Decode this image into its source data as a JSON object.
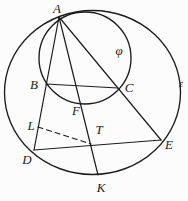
{
  "colors": {
    "ink": "#1c1c1c",
    "paper": "#fcfcfc"
  },
  "diagram": {
    "type": "geometry-figure",
    "labels": {
      "A": "A",
      "B": "B",
      "C": "C",
      "D": "D",
      "E": "E",
      "F": "F",
      "K": "K",
      "L": "L",
      "T": "T",
      "phi": "φ",
      "epsilon": "ε"
    },
    "points": [
      {
        "name": "A",
        "x": 59,
        "y": 17,
        "on": [
          "circle-epsilon",
          "circle-phi"
        ]
      },
      {
        "name": "B",
        "x": 46,
        "y": 84,
        "on": [
          "circle-phi",
          "line-AD"
        ]
      },
      {
        "name": "C",
        "x": 118,
        "y": 88,
        "on": [
          "circle-phi",
          "line-AE"
        ]
      },
      {
        "name": "F",
        "x": 80,
        "y": 103,
        "on": [
          "circle-phi",
          "line-AK"
        ]
      },
      {
        "name": "L",
        "x": 38,
        "y": 126,
        "on": [
          "line-AD"
        ]
      },
      {
        "name": "T",
        "x": 92,
        "y": 145,
        "on": [
          "line-AK",
          "line-DE"
        ]
      },
      {
        "name": "D",
        "x": 34,
        "y": 150,
        "on": [
          "circle-epsilon"
        ]
      },
      {
        "name": "E",
        "x": 161,
        "y": 140,
        "on": [
          "circle-epsilon"
        ]
      },
      {
        "name": "K",
        "x": 98,
        "y": 175,
        "on": [
          "circle-epsilon"
        ]
      }
    ],
    "circles": [
      {
        "name": "epsilon",
        "label": "ε",
        "cx": 92.5,
        "cy": 92.5,
        "rx": 88,
        "ry": 82
      },
      {
        "name": "phi",
        "label": "φ",
        "cx": 85,
        "cy": 58,
        "r": 46
      }
    ],
    "segments": [
      {
        "name": "line-AD",
        "from": "A",
        "to": "D",
        "style": "solid"
      },
      {
        "name": "line-AK",
        "from": "A",
        "to": "K",
        "style": "solid"
      },
      {
        "name": "line-AE",
        "from": "A",
        "to": "E",
        "style": "solid"
      },
      {
        "name": "chord-BC",
        "from": "B",
        "to": "C",
        "style": "solid"
      },
      {
        "name": "line-DE",
        "from": "D",
        "to": "E",
        "style": "solid"
      },
      {
        "name": "segment-LT",
        "from": "L",
        "to": "T",
        "style": "dashed"
      }
    ]
  }
}
